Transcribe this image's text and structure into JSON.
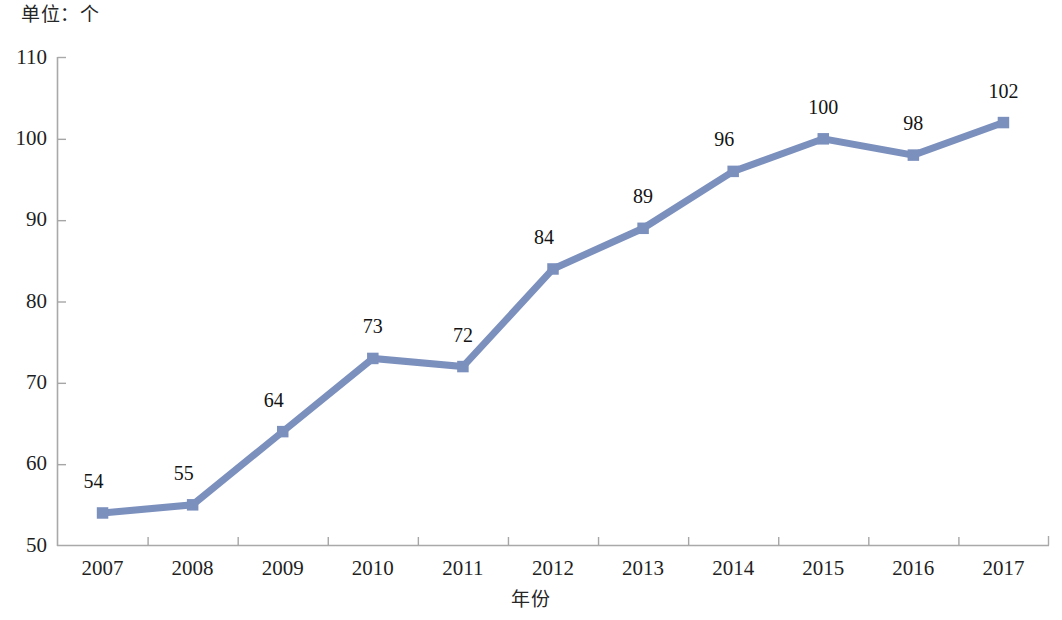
{
  "chart_data": {
    "type": "line",
    "title": "单位：个",
    "xlabel": "年份",
    "ylabel": "",
    "categories": [
      "2007",
      "2008",
      "2009",
      "2010",
      "2011",
      "2012",
      "2013",
      "2014",
      "2015",
      "2016",
      "2017"
    ],
    "values": [
      54,
      55,
      64,
      73,
      72,
      84,
      89,
      96,
      100,
      98,
      102
    ],
    "point_labels": [
      "54",
      "55",
      "64",
      "73",
      "72",
      "84",
      "89",
      "96",
      "100",
      "98",
      "102"
    ],
    "ylim": [
      50,
      110
    ],
    "y_ticks": [
      "110",
      "100",
      "90",
      "80",
      "70",
      "60",
      "50"
    ],
    "y_tick_values": [
      110,
      100,
      90,
      80,
      70,
      60,
      50
    ],
    "grid": false,
    "legend": false,
    "legend_position": "none",
    "series": [
      {
        "name": "",
        "values": [
          54,
          55,
          64,
          73,
          72,
          84,
          89,
          96,
          100,
          98,
          102
        ],
        "color": "#7c90be",
        "marker": "square"
      }
    ],
    "colors": {
      "line": "#7c90be",
      "marker": "#7c90be",
      "axis": "#a6a6a6",
      "text": "#1f1f1f"
    }
  }
}
